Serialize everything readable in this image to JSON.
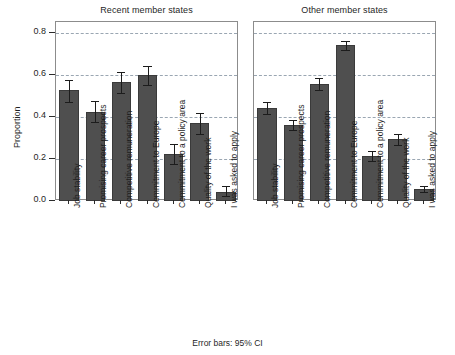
{
  "figure": {
    "ylabel": "Proportion",
    "footer": "Error bars: 95% CI",
    "bar_color": "#4f4f4f",
    "grid_color": "#9aa6b2",
    "frame_color": "#8c8c8c"
  },
  "chart_data": {
    "type": "bar",
    "title": "",
    "xlabel": "",
    "ylabel": "Proportion",
    "ylim": [
      0.0,
      0.85
    ],
    "yticks": [
      0.0,
      0.2,
      0.4,
      0.6,
      0.8
    ],
    "ytick_labels": [
      "0.0",
      "0.2",
      "0.4",
      "0.6",
      "0.8"
    ],
    "grid": true,
    "legend": "none",
    "annotation": "Error bars: 95% CI",
    "categories": [
      "Job stability",
      "Promising career prospects",
      "Competitive remuneration",
      "Commitment to Europe",
      "Commitment to a policy area",
      "Quality of the work",
      "I was asked to apply"
    ],
    "panels": [
      {
        "title": "Recent member states",
        "values": [
          0.525,
          0.425,
          0.565,
          0.597,
          0.224,
          0.371,
          0.045
        ],
        "ci_low": [
          0.47,
          0.374,
          0.515,
          0.552,
          0.177,
          0.32,
          0.024
        ],
        "ci_high": [
          0.576,
          0.475,
          0.611,
          0.639,
          0.27,
          0.42,
          0.069
        ]
      },
      {
        "title": "Other member states",
        "values": [
          0.44,
          0.36,
          0.556,
          0.739,
          0.214,
          0.293,
          0.055
        ],
        "ci_low": [
          0.411,
          0.336,
          0.528,
          0.715,
          0.192,
          0.268,
          0.044
        ],
        "ci_high": [
          0.468,
          0.385,
          0.585,
          0.762,
          0.236,
          0.317,
          0.069
        ]
      }
    ]
  }
}
